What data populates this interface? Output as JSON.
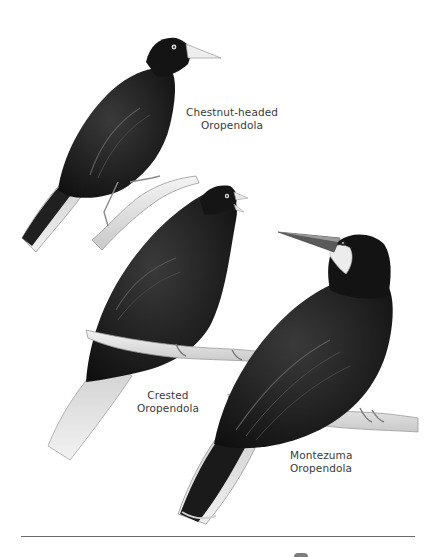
{
  "plate": {
    "colors": {
      "background": "#ffffff",
      "plumage": "#151515",
      "plumage_mid": "#2e2e2e",
      "plumage_highlight": "#5a5a5a",
      "tail_pale": "#e6e6e6",
      "branch": "#e4e4e4",
      "label_text": "#3a3a3a",
      "rule": "#6b6b6b"
    },
    "birds": [
      {
        "name_line1": "Chestnut-headed",
        "name_line2": "Oropendola",
        "pose": "perched on branch, facing right, upper left"
      },
      {
        "name_line1": "Crested",
        "name_line2": "Oropendola",
        "pose": "perched on horizontal branch, head raised, center"
      },
      {
        "name_line1": "Montezuma",
        "name_line2": "Oropendola",
        "pose": "perched on branch, facing left, lower right"
      }
    ]
  }
}
